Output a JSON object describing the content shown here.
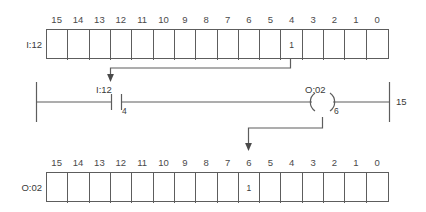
{
  "diagram": {
    "line_color": "#5d5d5d",
    "text_color": "#3a3a3a"
  },
  "input_word": {
    "label": "I:12",
    "bit_headers": [
      "15",
      "14",
      "13",
      "12",
      "11",
      "10",
      "9",
      "8",
      "7",
      "6",
      "5",
      "4",
      "3",
      "2",
      "1",
      "0"
    ],
    "bit_values": [
      "",
      "",
      "",
      "",
      "",
      "",
      "",
      "",
      "",
      "",
      "",
      "1",
      "",
      "",
      "",
      ""
    ],
    "set_bit": "4",
    "set_value": "1"
  },
  "output_word": {
    "label": "O:02",
    "bit_headers": [
      "15",
      "14",
      "13",
      "12",
      "11",
      "10",
      "9",
      "8",
      "7",
      "6",
      "5",
      "4",
      "3",
      "2",
      "1",
      "0"
    ],
    "bit_values": [
      "",
      "",
      "",
      "",
      "",
      "",
      "",
      "",
      "",
      "1",
      "",
      "",
      "",
      "",
      "",
      ""
    ],
    "set_bit": "6",
    "set_value": "1"
  },
  "rung": {
    "number": "15",
    "contact": {
      "address": "I:12",
      "bit": "4",
      "type": "examine-if-closed"
    },
    "coil": {
      "address": "O:02",
      "bit": "6",
      "type": "output-energize"
    }
  }
}
